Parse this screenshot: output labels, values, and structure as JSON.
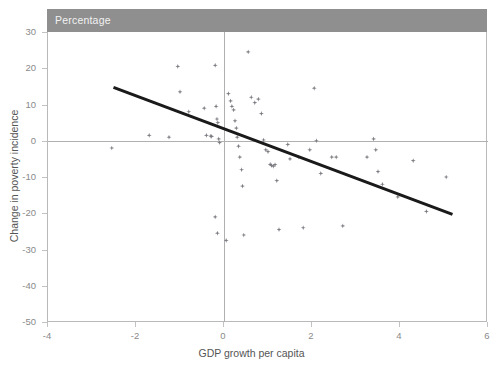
{
  "header": {
    "band_label": "Percentage",
    "band_color": "#8f8f8f"
  },
  "chart_data": {
    "type": "scatter",
    "title": "Percentage",
    "xlabel": "GDP growth per capita",
    "ylabel": "Change in poverty incidence",
    "xlim": [
      -4,
      6
    ],
    "ylim": [
      -50,
      30
    ],
    "xticks": [
      -4,
      -2,
      0,
      2,
      4,
      6
    ],
    "yticks": [
      30,
      20,
      10,
      0,
      -10,
      -20,
      -30,
      -40,
      -50
    ],
    "xticklabels": [
      "-4",
      "-2",
      "0",
      "2",
      "4",
      "6"
    ],
    "yticklabels": [
      "30",
      "20",
      "10",
      "0",
      "-10",
      "-20",
      "-30",
      "-40",
      "-50"
    ],
    "grid": false,
    "legend": "none",
    "marker_color": "#7b7b81",
    "marker_shape": "diamond-plus",
    "zero_lines": {
      "x": 0,
      "y": 0,
      "color": "#b0b0b0"
    },
    "trendline": {
      "color": "#1a1a1a",
      "width": 3,
      "x": [
        -2.5,
        5.2
      ],
      "y": [
        15.0,
        -20.0
      ],
      "slope": -4.5,
      "intercept": 3.75
    },
    "points": [
      {
        "x": -2.55,
        "y": -2.0
      },
      {
        "x": -1.7,
        "y": 1.5
      },
      {
        "x": -1.25,
        "y": 1.0
      },
      {
        "x": -1.05,
        "y": 20.5
      },
      {
        "x": -1.0,
        "y": 13.5
      },
      {
        "x": -0.8,
        "y": 8.0
      },
      {
        "x": -0.45,
        "y": 9.0
      },
      {
        "x": -0.4,
        "y": 1.5
      },
      {
        "x": -0.3,
        "y": 1.3
      },
      {
        "x": -0.28,
        "y": 1.2
      },
      {
        "x": -0.2,
        "y": 20.8
      },
      {
        "x": -0.18,
        "y": 9.5
      },
      {
        "x": -0.16,
        "y": 6.0
      },
      {
        "x": -0.14,
        "y": 5.0
      },
      {
        "x": -0.12,
        "y": 0.5
      },
      {
        "x": -0.1,
        "y": -0.5
      },
      {
        "x": -0.2,
        "y": -21.0
      },
      {
        "x": -0.15,
        "y": -25.5
      },
      {
        "x": 0.05,
        "y": -27.5
      },
      {
        "x": 0.1,
        "y": 13.0
      },
      {
        "x": 0.15,
        "y": 11.0
      },
      {
        "x": 0.18,
        "y": 9.5
      },
      {
        "x": 0.22,
        "y": 8.5
      },
      {
        "x": 0.25,
        "y": 5.5
      },
      {
        "x": 0.28,
        "y": 3.5
      },
      {
        "x": 0.3,
        "y": 1.0
      },
      {
        "x": 0.33,
        "y": -1.5
      },
      {
        "x": 0.36,
        "y": -4.5
      },
      {
        "x": 0.4,
        "y": -8.0
      },
      {
        "x": 0.42,
        "y": -12.5
      },
      {
        "x": 0.45,
        "y": -26.0
      },
      {
        "x": 0.55,
        "y": 24.5
      },
      {
        "x": 0.62,
        "y": 12.0
      },
      {
        "x": 0.7,
        "y": 10.5
      },
      {
        "x": 0.78,
        "y": 11.5
      },
      {
        "x": 0.85,
        "y": 7.5
      },
      {
        "x": 0.9,
        "y": 0.2
      },
      {
        "x": 0.95,
        "y": -2.5
      },
      {
        "x": 1.0,
        "y": -3.0
      },
      {
        "x": 1.05,
        "y": -6.5
      },
      {
        "x": 1.08,
        "y": -6.8
      },
      {
        "x": 1.12,
        "y": -7.0
      },
      {
        "x": 1.16,
        "y": -6.6
      },
      {
        "x": 1.2,
        "y": -11.0
      },
      {
        "x": 1.25,
        "y": -24.5
      },
      {
        "x": 1.45,
        "y": -1.0
      },
      {
        "x": 1.5,
        "y": -5.0
      },
      {
        "x": 1.7,
        "y": -4.5
      },
      {
        "x": 1.8,
        "y": -24.0
      },
      {
        "x": 1.95,
        "y": -2.5
      },
      {
        "x": 2.05,
        "y": 14.5
      },
      {
        "x": 2.1,
        "y": 0.0
      },
      {
        "x": 2.2,
        "y": -9.0
      },
      {
        "x": 2.45,
        "y": -4.5
      },
      {
        "x": 2.55,
        "y": -4.5
      },
      {
        "x": 2.7,
        "y": -23.5
      },
      {
        "x": 3.25,
        "y": -4.5
      },
      {
        "x": 3.4,
        "y": 0.5
      },
      {
        "x": 3.45,
        "y": -2.5
      },
      {
        "x": 3.5,
        "y": -8.5
      },
      {
        "x": 3.6,
        "y": -12.0
      },
      {
        "x": 3.95,
        "y": -15.5
      },
      {
        "x": 4.3,
        "y": -5.5
      },
      {
        "x": 4.6,
        "y": -19.5
      },
      {
        "x": 5.05,
        "y": -10.0
      }
    ]
  }
}
